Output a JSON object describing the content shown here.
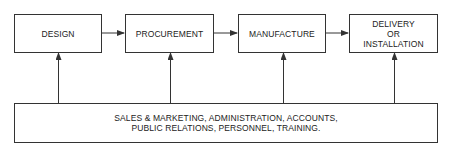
{
  "diagram": {
    "stages": [
      {
        "id": "design",
        "lines": [
          "DESIGN"
        ]
      },
      {
        "id": "procurement",
        "lines": [
          "PROCUREMENT"
        ]
      },
      {
        "id": "manufacture",
        "lines": [
          "MANUFACTURE"
        ]
      },
      {
        "id": "delivery",
        "lines": [
          "DELIVERY",
          "OR",
          "INSTALLATION"
        ]
      }
    ],
    "support": {
      "lines": [
        "SALES & MARKETING, ADMINISTRATION, ACCOUNTS,",
        "PUBLIC RELATIONS, PERSONNEL, TRAINING."
      ]
    },
    "flow": [
      "design → procurement",
      "procurement → manufacture",
      "manufacture → delivery"
    ],
    "support_arrows_to": [
      "design",
      "procurement",
      "manufacture",
      "delivery"
    ],
    "colors": {
      "line": "#333333",
      "background": "#ffffff"
    }
  }
}
